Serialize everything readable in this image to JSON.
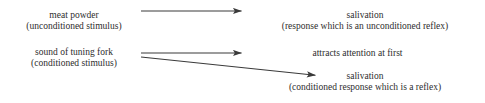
{
  "diagram": {
    "type": "classical-conditioning-flow",
    "background_color": "#ffffff",
    "text_color": "#2d2d2d",
    "arrow_color": "#3a3a3a",
    "nodes": {
      "stimulus_unconditioned": {
        "line1": "meat powder",
        "line2": "(unconditioned stimulus)"
      },
      "response_unconditioned": {
        "line1": "salivation",
        "line2": "(response which is an unconditioned reflex)"
      },
      "stimulus_conditioned": {
        "line1": "sound of tuning fork",
        "line2": "(conditioned stimulus)"
      },
      "attention_note": {
        "line1": "attracts attention at first"
      },
      "response_conditioned": {
        "line1": "salivation",
        "line2": "(conditioned response which is a reflex)"
      }
    },
    "arrows": [
      {
        "name": "arrow-meat-powder-to-salivation",
        "from": "stimulus_unconditioned",
        "to": "response_unconditioned",
        "x1": 141,
        "y1": 11,
        "x2": 249,
        "y2": 11
      },
      {
        "name": "arrow-tuning-fork-to-attention",
        "from": "stimulus_conditioned",
        "to": "attention_note",
        "x1": 141,
        "y1": 53,
        "x2": 249,
        "y2": 53
      },
      {
        "name": "arrow-tuning-fork-to-conditioned-salivation",
        "from": "stimulus_conditioned",
        "to": "response_conditioned",
        "x1": 141,
        "y1": 57,
        "x2": 323,
        "y2": 76
      }
    ]
  }
}
